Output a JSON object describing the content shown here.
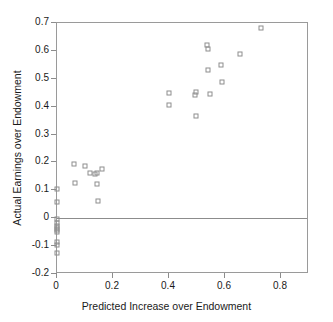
{
  "chart_data": {
    "type": "scatter",
    "title": "",
    "xlabel": "Predicted Increase over Endowment",
    "ylabel": "Actual Earnings over Endowment",
    "xlim": [
      0.0,
      0.9
    ],
    "ylim": [
      -0.2,
      0.7
    ],
    "xticks": [
      "0",
      "0.2",
      "0.4",
      "0.6",
      "0.8"
    ],
    "xtick_values": [
      0.0,
      0.2,
      0.4,
      0.6,
      0.8
    ],
    "yticks": [
      "0.7",
      "0.6",
      "0.5",
      "0.4",
      "0.3",
      "0.2",
      "0.1",
      "0",
      "-0.1",
      "-0.2"
    ],
    "ytick_values": [
      0.7,
      0.6,
      0.5,
      0.4,
      0.3,
      0.2,
      0.1,
      0.0,
      -0.1,
      -0.2
    ],
    "grid": false,
    "legend": "none",
    "marker": "open-square",
    "marker_color": "#8e8e8e",
    "reference_line": {
      "axis": "y",
      "value": 0.0,
      "color": "#8c8c8c"
    },
    "frame_color": "#9a9a9a",
    "points": [
      {
        "x": 0.0,
        "y": 0.105
      },
      {
        "x": 0.0,
        "y": 0.057
      },
      {
        "x": 0.0,
        "y": -0.004
      },
      {
        "x": 0.0,
        "y": -0.018
      },
      {
        "x": 0.0,
        "y": -0.027
      },
      {
        "x": 0.0,
        "y": -0.034
      },
      {
        "x": 0.0,
        "y": -0.041
      },
      {
        "x": 0.0,
        "y": -0.048
      },
      {
        "x": 0.0,
        "y": -0.086
      },
      {
        "x": 0.0,
        "y": -0.097
      },
      {
        "x": 0.0,
        "y": -0.124
      },
      {
        "x": 0.061,
        "y": 0.194
      },
      {
        "x": 0.064,
        "y": 0.127
      },
      {
        "x": 0.1,
        "y": 0.189
      },
      {
        "x": 0.119,
        "y": 0.163
      },
      {
        "x": 0.136,
        "y": 0.158
      },
      {
        "x": 0.142,
        "y": 0.121
      },
      {
        "x": 0.144,
        "y": 0.161
      },
      {
        "x": 0.146,
        "y": 0.063
      },
      {
        "x": 0.16,
        "y": 0.176
      },
      {
        "x": 0.399,
        "y": 0.449
      },
      {
        "x": 0.4,
        "y": 0.406
      },
      {
        "x": 0.492,
        "y": 0.443
      },
      {
        "x": 0.495,
        "y": 0.452
      },
      {
        "x": 0.497,
        "y": 0.368
      },
      {
        "x": 0.537,
        "y": 0.62
      },
      {
        "x": 0.538,
        "y": 0.607
      },
      {
        "x": 0.541,
        "y": 0.533
      },
      {
        "x": 0.545,
        "y": 0.447
      },
      {
        "x": 0.585,
        "y": 0.549
      },
      {
        "x": 0.589,
        "y": 0.488
      },
      {
        "x": 0.652,
        "y": 0.588
      },
      {
        "x": 0.729,
        "y": 0.681
      }
    ]
  }
}
